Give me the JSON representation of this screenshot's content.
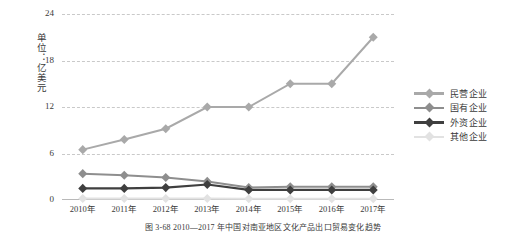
{
  "figure": {
    "caption": "图 3-68    2010—2017 年中国对南亚地区文化产品出口贸易变化趋势",
    "ylabel_text": "单位：亿美元"
  },
  "chart_data": {
    "type": "line",
    "title": "2010—2017 年中国对南亚地区文化产品出口贸易变化趋势",
    "xlabel": "",
    "ylabel": "单位：亿美元",
    "categories": [
      "2010年",
      "2011年",
      "2012年",
      "2013年",
      "2014年",
      "2015年",
      "2016年",
      "2017年"
    ],
    "yticks": [
      0,
      6,
      12,
      18,
      24
    ],
    "ylim": [
      0,
      24
    ],
    "grid": true,
    "legend_position": "right",
    "series": [
      {
        "name": "民营企业",
        "color": "#a9a9a9",
        "values": [
          6.5,
          7.8,
          9.2,
          12.0,
          12.0,
          15.0,
          15.0,
          21.0
        ]
      },
      {
        "name": "国有企业",
        "color": "#8e8e8e",
        "values": [
          3.4,
          3.2,
          2.9,
          2.4,
          1.6,
          1.7,
          1.7,
          1.7
        ]
      },
      {
        "name": "外资企业",
        "color": "#3f3f3f",
        "values": [
          1.5,
          1.5,
          1.6,
          2.0,
          1.3,
          1.3,
          1.3,
          1.3
        ]
      },
      {
        "name": "其他企业",
        "color": "#e2e2e2",
        "values": [
          0.2,
          0.2,
          0.2,
          0.2,
          0.15,
          0.15,
          0.15,
          0.15
        ]
      }
    ]
  }
}
